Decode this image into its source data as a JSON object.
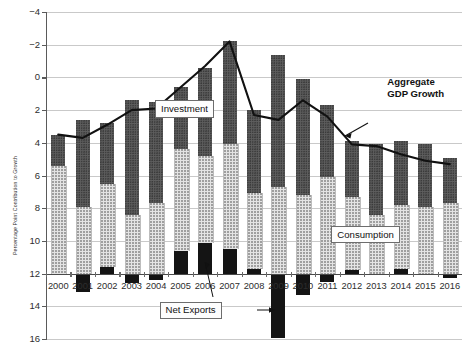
{
  "chart_data": {
    "type": "bar",
    "title": "",
    "subtitle": "",
    "xlabel": "",
    "ylabel": "Percentage Point Contribution to Growth",
    "ylim": [
      -4,
      16
    ],
    "yticks": [
      -4,
      -2,
      0,
      2,
      4,
      6,
      8,
      10,
      12,
      14,
      16
    ],
    "grid": true,
    "stacked": true,
    "legend_position": "inline-callouts",
    "categories": [
      "2000",
      "2001",
      "2002",
      "2003",
      "2004",
      "2005",
      "2006",
      "2007",
      "2008",
      "2009",
      "2010",
      "2011",
      "2012",
      "2013",
      "2014",
      "2015",
      "2016"
    ],
    "series": [
      {
        "name": "Consumption",
        "style": "light-dotted",
        "color": "#e4e4e4",
        "values": [
          6.6,
          4.1,
          5.1,
          3.6,
          4.3,
          6.2,
          5.3,
          6.4,
          4.6,
          5.3,
          4.8,
          5.9,
          4.5,
          3.6,
          3.9,
          4.1,
          4.3
        ]
      },
      {
        "name": "Investment",
        "style": "dark-dotted",
        "color": "#5e5e5e",
        "values": [
          1.9,
          5.3,
          3.7,
          7.0,
          6.2,
          3.8,
          5.4,
          6.3,
          5.1,
          8.1,
          7.1,
          4.4,
          3.4,
          4.3,
          3.9,
          3.8,
          2.8
        ]
      },
      {
        "name": "Net Exports",
        "style": "solid-black",
        "color": "#141414",
        "values": [
          0.0,
          -1.1,
          0.4,
          -0.6,
          -0.4,
          1.4,
          1.9,
          1.5,
          0.3,
          -3.95,
          -1.3,
          -0.5,
          0.2,
          -0.1,
          0.3,
          -0.1,
          -0.3
        ]
      }
    ],
    "line_series": {
      "name": "Aggregate GDP Growth",
      "color": "#111111",
      "values": [
        8.5,
        8.3,
        9.1,
        10.0,
        10.1,
        11.4,
        12.7,
        14.2,
        9.7,
        9.4,
        10.6,
        9.6,
        7.9,
        7.8,
        7.3,
        6.9,
        6.7
      ]
    },
    "annotations": [
      {
        "name": "investment-callout",
        "text": "Investment",
        "x_year": "2006",
        "y_value": 10.1
      },
      {
        "name": "consumption-callout",
        "text": "Consumption",
        "x_year": "2013",
        "y_value": 2.4
      },
      {
        "name": "netexports-callout",
        "text": "Net Exports",
        "x_year": "2007",
        "y_value": -2.2
      },
      {
        "name": "gdp-growth-annotation",
        "line1": "Aggregate",
        "line2": "GDP Growth",
        "x_year": "2015",
        "y_value": 11.6
      }
    ]
  },
  "labels": {
    "y_axis_title": "Percentage Point Contribution to Growth",
    "investment": "Investment",
    "consumption": "Consumption",
    "net_exports": "Net Exports",
    "gdp_line1": "Aggregate",
    "gdp_line2": "GDP Growth"
  },
  "ytick_labels": [
    "16",
    "14",
    "12",
    "10",
    "8",
    "6",
    "4",
    "2",
    "0",
    "−2",
    "−4"
  ],
  "xtick_labels": [
    "2000",
    "2001",
    "2002",
    "2003",
    "2004",
    "2005",
    "2006",
    "2007",
    "2008",
    "2009",
    "2010",
    "2011",
    "2012",
    "2013",
    "2014",
    "2015",
    "2016"
  ]
}
